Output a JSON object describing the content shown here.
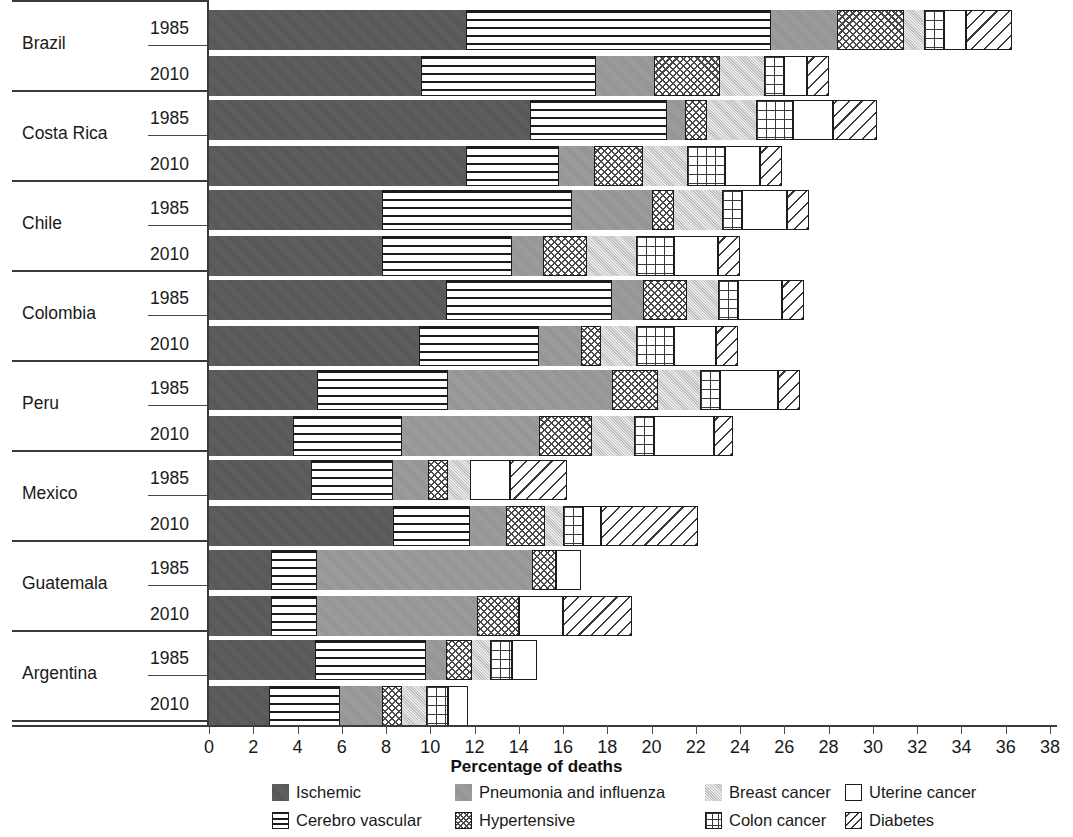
{
  "chart_data": {
    "type": "bar",
    "subtype": "horizontal-stacked-grouped",
    "title": "",
    "xlabel": "Percentage of deaths",
    "ylabel": "",
    "xlim": [
      0,
      38
    ],
    "xticks": [
      0,
      2,
      4,
      6,
      8,
      10,
      12,
      14,
      16,
      18,
      20,
      22,
      24,
      26,
      28,
      30,
      32,
      34,
      36,
      38
    ],
    "grid": false,
    "legend_position": "bottom",
    "series": [
      {
        "name": "Ischemic",
        "key": "ischemic",
        "color": "#595959",
        "pattern": "solid-dark-gray"
      },
      {
        "name": "Cerebro vascular",
        "key": "cerebro",
        "color": "#ffffff",
        "pattern": "horizontal-lines"
      },
      {
        "name": "Pneumonia and influenza",
        "key": "pneumonia",
        "color": "#9a9a9a",
        "pattern": "solid-mid-gray"
      },
      {
        "name": "Hypertensive",
        "key": "hypertensive",
        "color": "#ffffff",
        "pattern": "cross-hatch-diagonal"
      },
      {
        "name": "Breast cancer",
        "key": "breast",
        "color": "#d9d9d9",
        "pattern": "solid-light-gray"
      },
      {
        "name": "Colon cancer",
        "key": "colon",
        "color": "#ffffff",
        "pattern": "grid"
      },
      {
        "name": "Uterine cancer",
        "key": "uterine",
        "color": "#ffffff",
        "pattern": "empty"
      },
      {
        "name": "Diabetes",
        "key": "diabetes",
        "color": "#ffffff",
        "pattern": "diagonal-hatch"
      }
    ],
    "categories": [
      "Brazil",
      "Costa Rica",
      "Chile",
      "Colombia",
      "Peru",
      "Mexico",
      "Guatemala",
      "Argentina"
    ],
    "years": [
      "1985",
      "2010"
    ],
    "groups": [
      {
        "country": "Brazil",
        "rows": [
          {
            "year": "1985",
            "values": {
              "ischemic": 11.6,
              "cerebro": 13.8,
              "pneumonia": 3.0,
              "hypertensive": 3.0,
              "breast": 0.9,
              "colon": 0.9,
              "uterine": 1.0,
              "diabetes": 2.1
            },
            "total": 36.3
          },
          {
            "year": "2010",
            "values": {
              "ischemic": 9.6,
              "cerebro": 7.9,
              "pneumonia": 2.6,
              "hypertensive": 3.0,
              "breast": 2.0,
              "colon": 0.9,
              "uterine": 1.0,
              "diabetes": 1.0
            },
            "total": 28.0
          }
        ]
      },
      {
        "country": "Costa Rica",
        "rows": [
          {
            "year": "1985",
            "values": {
              "ischemic": 14.5,
              "cerebro": 6.2,
              "pneumonia": 0.8,
              "hypertensive": 1.0,
              "breast": 2.2,
              "colon": 1.7,
              "uterine": 1.8,
              "diabetes": 2.0
            },
            "total": 30.2
          },
          {
            "year": "2010",
            "values": {
              "ischemic": 11.6,
              "cerebro": 4.2,
              "pneumonia": 1.6,
              "hypertensive": 2.2,
              "breast": 2.0,
              "colon": 1.7,
              "uterine": 1.6,
              "diabetes": 1.0
            },
            "total": 25.9
          }
        ]
      },
      {
        "country": "Chile",
        "rows": [
          {
            "year": "1985",
            "values": {
              "ischemic": 7.8,
              "cerebro": 8.6,
              "pneumonia": 3.6,
              "hypertensive": 1.0,
              "breast": 2.2,
              "colon": 0.9,
              "uterine": 2.0,
              "diabetes": 1.0
            },
            "total": 27.1
          },
          {
            "year": "2010",
            "values": {
              "ischemic": 7.8,
              "cerebro": 5.9,
              "pneumonia": 1.4,
              "hypertensive": 2.0,
              "breast": 2.2,
              "colon": 1.7,
              "uterine": 2.0,
              "diabetes": 1.0
            },
            "total": 24.0
          }
        ]
      },
      {
        "country": "Colombia",
        "rows": [
          {
            "year": "1985",
            "values": {
              "ischemic": 10.7,
              "cerebro": 7.5,
              "pneumonia": 1.4,
              "hypertensive": 2.0,
              "breast": 1.4,
              "colon": 0.9,
              "uterine": 2.0,
              "diabetes": 1.0
            },
            "total": 26.9
          },
          {
            "year": "2010",
            "values": {
              "ischemic": 9.5,
              "cerebro": 5.4,
              "pneumonia": 1.9,
              "hypertensive": 0.9,
              "breast": 1.6,
              "colon": 1.7,
              "uterine": 1.9,
              "diabetes": 1.0
            },
            "total": 23.9
          }
        ]
      },
      {
        "country": "Peru",
        "rows": [
          {
            "year": "1985",
            "values": {
              "ischemic": 4.9,
              "cerebro": 5.9,
              "pneumonia": 7.4,
              "hypertensive": 2.1,
              "breast": 1.9,
              "colon": 0.9,
              "uterine": 2.6,
              "diabetes": 1.0
            },
            "total": 26.7
          },
          {
            "year": "2010",
            "values": {
              "ischemic": 3.8,
              "cerebro": 4.9,
              "pneumonia": 6.2,
              "hypertensive": 2.4,
              "breast": 1.9,
              "colon": 0.9,
              "uterine": 2.7,
              "diabetes": 0.9
            },
            "total": 23.7
          }
        ]
      },
      {
        "country": "Mexico",
        "rows": [
          {
            "year": "1985",
            "values": {
              "ischemic": 4.6,
              "cerebro": 3.7,
              "pneumonia": 1.6,
              "hypertensive": 0.9,
              "breast": 1.0,
              "colon": 0.0,
              "uterine": 1.8,
              "diabetes": 2.6
            },
            "total": 16.2
          },
          {
            "year": "2010",
            "values": {
              "ischemic": 8.3,
              "cerebro": 3.5,
              "pneumonia": 1.6,
              "hypertensive": 1.8,
              "breast": 0.8,
              "colon": 0.9,
              "uterine": 0.8,
              "diabetes": 4.4
            },
            "total": 22.1
          }
        ]
      },
      {
        "country": "Guatemala",
        "rows": [
          {
            "year": "1985",
            "values": {
              "ischemic": 2.8,
              "cerebro": 2.1,
              "pneumonia": 9.7,
              "hypertensive": 1.1,
              "breast": 0.0,
              "colon": 0.0,
              "uterine": 1.1,
              "diabetes": 0.0
            },
            "total": 16.8
          },
          {
            "year": "2010",
            "values": {
              "ischemic": 2.8,
              "cerebro": 2.1,
              "pneumonia": 7.2,
              "hypertensive": 1.9,
              "breast": 0.0,
              "colon": 0.0,
              "uterine": 2.0,
              "diabetes": 3.1
            },
            "total": 19.1
          }
        ]
      },
      {
        "country": "Argentina",
        "rows": [
          {
            "year": "1985",
            "values": {
              "ischemic": 4.8,
              "cerebro": 5.0,
              "pneumonia": 0.9,
              "hypertensive": 1.2,
              "breast": 0.8,
              "colon": 1.0,
              "uterine": 1.1,
              "diabetes": 0.0
            },
            "total": 14.8
          },
          {
            "year": "2010",
            "values": {
              "ischemic": 2.7,
              "cerebro": 3.2,
              "pneumonia": 1.9,
              "hypertensive": 0.9,
              "breast": 1.1,
              "colon": 1.0,
              "uterine": 0.9,
              "diabetes": 0.0
            },
            "total": 11.7
          }
        ]
      }
    ]
  },
  "axis": {
    "x_title": "Percentage of deaths",
    "tick_labels": [
      "0",
      "2",
      "4",
      "6",
      "8",
      "10",
      "12",
      "14",
      "16",
      "18",
      "20",
      "22",
      "24",
      "26",
      "28",
      "30",
      "32",
      "34",
      "36",
      "38"
    ]
  },
  "legend": {
    "row1": [
      {
        "label": "Ischemic",
        "key": "ischemic"
      },
      {
        "label": "Pneumonia and influenza",
        "key": "pneumonia"
      },
      {
        "label": "Breast cancer",
        "key": "breast"
      },
      {
        "label": "Uterine cancer",
        "key": "uterine"
      }
    ],
    "row2": [
      {
        "label": "Cerebro vascular",
        "key": "cerebro"
      },
      {
        "label": "Hypertensive",
        "key": "hypertensive"
      },
      {
        "label": "Colon cancer",
        "key": "colon"
      },
      {
        "label": "Diabetes",
        "key": "diabetes"
      }
    ]
  }
}
